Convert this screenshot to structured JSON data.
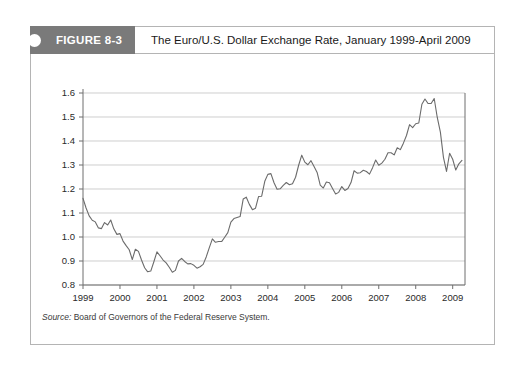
{
  "figure": {
    "tab_label": "FIGURE 8-3",
    "title": "The Euro/U.S. Dollar Exchange Rate, January 1999-April 2009",
    "source_label": "Source:",
    "source_text": " Board of Governors of the Federal Reserve System."
  },
  "colors": {
    "tab_background": "#7a7a7a",
    "tab_text": "#ffffff",
    "frame_border": "#b4b4b4",
    "gridline": "#b9b9b9",
    "axis": "#6e6e6e",
    "data_line": "#6b6b6b",
    "page_background": "#ffffff"
  },
  "chart_data": {
    "type": "line",
    "title": "The Euro/U.S. Dollar Exchange Rate, January 1999-April 2009",
    "xlabel": "",
    "ylabel": "",
    "xlim": [
      1999.0,
      2009.333
    ],
    "ylim": [
      0.8,
      1.6
    ],
    "grid": true,
    "legend": "none",
    "ytick_labels": [
      "1.6",
      "1.5",
      "1.4",
      "1.3",
      "1.2",
      "1.1",
      "1.0",
      "0.9",
      "0.8"
    ],
    "ytick_values": [
      1.6,
      1.5,
      1.4,
      1.3,
      1.2,
      1.1,
      1.0,
      0.9,
      0.8
    ],
    "xtick_labels": [
      "1999",
      "2000",
      "2001",
      "2002",
      "2003",
      "2004",
      "2005",
      "2006",
      "2007",
      "2008",
      "2009"
    ],
    "xtick_values": [
      1999,
      2000,
      2001,
      2002,
      2003,
      2004,
      2005,
      2006,
      2007,
      2008,
      2009
    ],
    "series": [
      {
        "name": "Euro/U.S. Dollar Exchange Rate",
        "x": [
          1999.0,
          1999.083,
          1999.167,
          1999.25,
          1999.333,
          1999.417,
          1999.5,
          1999.583,
          1999.667,
          1999.75,
          1999.833,
          1999.917,
          2000.0,
          2000.083,
          2000.167,
          2000.25,
          2000.333,
          2000.417,
          2000.5,
          2000.583,
          2000.667,
          2000.75,
          2000.833,
          2000.917,
          2001.0,
          2001.083,
          2001.167,
          2001.25,
          2001.333,
          2001.417,
          2001.5,
          2001.583,
          2001.667,
          2001.75,
          2001.833,
          2001.917,
          2002.0,
          2002.083,
          2002.167,
          2002.25,
          2002.333,
          2002.417,
          2002.5,
          2002.583,
          2002.667,
          2002.75,
          2002.833,
          2002.917,
          2003.0,
          2003.083,
          2003.167,
          2003.25,
          2003.333,
          2003.417,
          2003.5,
          2003.583,
          2003.667,
          2003.75,
          2003.833,
          2003.917,
          2004.0,
          2004.083,
          2004.167,
          2004.25,
          2004.333,
          2004.417,
          2004.5,
          2004.583,
          2004.667,
          2004.75,
          2004.833,
          2004.917,
          2005.0,
          2005.083,
          2005.167,
          2005.25,
          2005.333,
          2005.417,
          2005.5,
          2005.583,
          2005.667,
          2005.75,
          2005.833,
          2005.917,
          2006.0,
          2006.083,
          2006.167,
          2006.25,
          2006.333,
          2006.417,
          2006.5,
          2006.583,
          2006.667,
          2006.75,
          2006.833,
          2006.917,
          2007.0,
          2007.083,
          2007.167,
          2007.25,
          2007.333,
          2007.417,
          2007.5,
          2007.583,
          2007.667,
          2007.75,
          2007.833,
          2007.917,
          2008.0,
          2008.083,
          2008.167,
          2008.25,
          2008.333,
          2008.417,
          2008.5,
          2008.583,
          2008.667,
          2008.75,
          2008.833,
          2008.917,
          2009.0,
          2009.083,
          2009.167,
          2009.25
        ],
        "y": [
          1.161,
          1.121,
          1.088,
          1.07,
          1.063,
          1.038,
          1.035,
          1.06,
          1.05,
          1.071,
          1.034,
          1.011,
          1.014,
          0.983,
          0.964,
          0.947,
          0.906,
          0.949,
          0.94,
          0.904,
          0.872,
          0.855,
          0.858,
          0.897,
          0.938,
          0.922,
          0.904,
          0.892,
          0.874,
          0.853,
          0.861,
          0.9,
          0.911,
          0.898,
          0.888,
          0.889,
          0.882,
          0.87,
          0.876,
          0.886,
          0.917,
          0.956,
          0.992,
          0.978,
          0.981,
          0.981,
          0.999,
          1.018,
          1.062,
          1.077,
          1.081,
          1.085,
          1.158,
          1.166,
          1.136,
          1.114,
          1.12,
          1.169,
          1.17,
          1.232,
          1.261,
          1.264,
          1.226,
          1.199,
          1.201,
          1.215,
          1.227,
          1.218,
          1.222,
          1.249,
          1.299,
          1.341,
          1.312,
          1.301,
          1.318,
          1.294,
          1.269,
          1.216,
          1.204,
          1.229,
          1.226,
          1.202,
          1.179,
          1.186,
          1.21,
          1.194,
          1.202,
          1.227,
          1.276,
          1.266,
          1.268,
          1.278,
          1.273,
          1.262,
          1.289,
          1.321,
          1.299,
          1.308,
          1.324,
          1.351,
          1.351,
          1.342,
          1.372,
          1.364,
          1.391,
          1.423,
          1.468,
          1.456,
          1.472,
          1.475,
          1.553,
          1.575,
          1.556,
          1.556,
          1.577,
          1.498,
          1.437,
          1.332,
          1.273,
          1.349,
          1.324,
          1.279,
          1.305,
          1.319
        ]
      }
    ],
    "annotations": [
      {
        "text": "Peak near 1.58 in mid-2008",
        "value": 1.577
      },
      {
        "text": "Trough near 0.85 in late 2000",
        "value": 0.853
      }
    ]
  }
}
